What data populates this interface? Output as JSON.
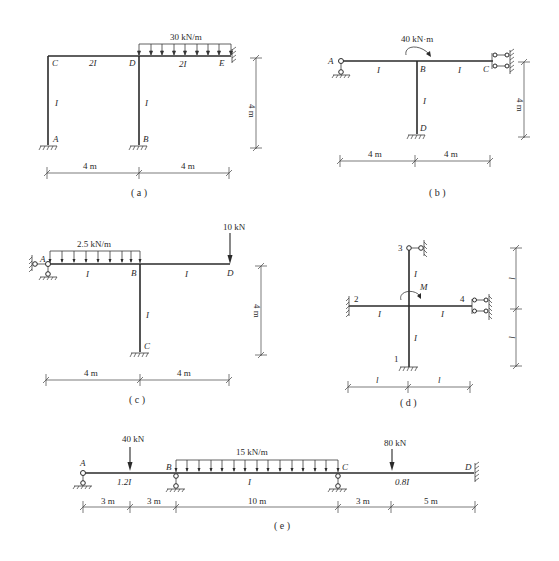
{
  "figure": {
    "panels": [
      {
        "id": "a",
        "caption": "( a )",
        "nodes": [
          "A",
          "B",
          "C",
          "D",
          "E"
        ],
        "members": [
          {
            "from": "C",
            "to": "D",
            "stiffness": "2I"
          },
          {
            "from": "D",
            "to": "E",
            "stiffness": "2I"
          },
          {
            "from": "A",
            "to": "C",
            "stiffness": "I"
          },
          {
            "from": "B",
            "to": "D",
            "stiffness": "I"
          }
        ],
        "supports": {
          "A": "fixed",
          "B": "fixed",
          "E": "fixed"
        },
        "loads": [
          {
            "type": "distributed",
            "on": "D-E",
            "label": "30 kN/m"
          }
        ],
        "dimensions": {
          "horizontal": [
            "4 m",
            "4 m"
          ],
          "vertical": [
            "4 m"
          ]
        }
      },
      {
        "id": "b",
        "caption": "( b )",
        "nodes": [
          "A",
          "B",
          "C",
          "D"
        ],
        "members": [
          {
            "from": "A",
            "to": "B",
            "stiffness": "I"
          },
          {
            "from": "B",
            "to": "C",
            "stiffness": "I"
          },
          {
            "from": "B",
            "to": "D",
            "stiffness": "I"
          }
        ],
        "supports": {
          "A": "pin",
          "C": "sliding",
          "D": "fixed"
        },
        "loads": [
          {
            "type": "moment",
            "at": "B",
            "label": "40 kN·m"
          }
        ],
        "dimensions": {
          "horizontal": [
            "4 m",
            "4 m"
          ],
          "vertical": [
            "4 m"
          ]
        }
      },
      {
        "id": "c",
        "caption": "( c )",
        "nodes": [
          "A",
          "B",
          "C",
          "D"
        ],
        "members": [
          {
            "from": "A",
            "to": "B",
            "stiffness": "I"
          },
          {
            "from": "B",
            "to": "D",
            "stiffness": "I"
          },
          {
            "from": "B",
            "to": "C",
            "stiffness": "I"
          }
        ],
        "supports": {
          "A": "pin",
          "C": "fixed"
        },
        "loads": [
          {
            "type": "distributed",
            "on": "A-B",
            "label": "2.5 kN/m"
          },
          {
            "type": "point",
            "at": "D",
            "label": "10 kN"
          }
        ],
        "dimensions": {
          "horizontal": [
            "4 m",
            "4 m"
          ],
          "vertical": [
            "4 m"
          ]
        }
      },
      {
        "id": "d",
        "caption": "( d )",
        "nodes": [
          "1",
          "2",
          "3",
          "4"
        ],
        "members": [
          {
            "from": "2",
            "to": "center",
            "stiffness": "I"
          },
          {
            "from": "center",
            "to": "4",
            "stiffness": "I"
          },
          {
            "from": "3",
            "to": "center",
            "stiffness": "I"
          },
          {
            "from": "center",
            "to": "1",
            "stiffness": "I"
          }
        ],
        "supports": {
          "1": "fixed",
          "2": "fixed",
          "3": "roller",
          "4": "sliding"
        },
        "loads": [
          {
            "type": "moment",
            "at": "center",
            "label": "M"
          }
        ],
        "dimensions": {
          "horizontal": [
            "l",
            "l"
          ],
          "vertical": [
            "l",
            "l"
          ]
        }
      },
      {
        "id": "e",
        "caption": "( e )",
        "nodes": [
          "A",
          "B",
          "C",
          "D"
        ],
        "members": [
          {
            "from": "A",
            "to": "B",
            "stiffness": "1.2I"
          },
          {
            "from": "B",
            "to": "C",
            "stiffness": "I"
          },
          {
            "from": "C",
            "to": "D",
            "stiffness": "0.8I"
          }
        ],
        "supports": {
          "A": "pin",
          "B": "pin",
          "C": "pin",
          "D": "fixed"
        },
        "loads": [
          {
            "type": "point",
            "on": "A-B",
            "label": "40 kN"
          },
          {
            "type": "distributed",
            "on": "B-C",
            "label": "15 kN/m"
          },
          {
            "type": "point",
            "on": "C-D",
            "label": "80 kN"
          }
        ],
        "dimensions": {
          "horizontal": [
            "3 m",
            "3 m",
            "10 m",
            "3 m",
            "5 m"
          ]
        }
      }
    ]
  },
  "a": {
    "load": "30 kN/m",
    "C": "C",
    "D": "D",
    "E": "E",
    "A": "A",
    "B": "B",
    "stiff_CD": "2I",
    "stiff_DE": "2I",
    "stiff_AC": "I",
    "stiff_BD": "I",
    "dim_h1": "4 m",
    "dim_h2": "4 m",
    "dim_v": "4 m",
    "caption": "( a )"
  },
  "b": {
    "moment": "40 kN·m",
    "A": "A",
    "B": "B",
    "C": "C",
    "D": "D",
    "stiff_AB": "I",
    "stiff_BC": "I",
    "stiff_BD": "I",
    "dim_h1": "4 m",
    "dim_h2": "4 m",
    "dim_v": "4 m",
    "caption": "( b )"
  },
  "c": {
    "load_dist": "2.5 kN/m",
    "load_point": "10 kN",
    "A": "A",
    "B": "B",
    "C": "C",
    "D": "D",
    "stiff_AB": "I",
    "stiff_BD": "I",
    "stiff_BC": "I",
    "dim_h1": "4 m",
    "dim_h2": "4 m",
    "dim_v": "4 m",
    "caption": "( c )"
  },
  "d": {
    "moment": "M",
    "n1": "1",
    "n2": "2",
    "n3": "3",
    "n4": "4",
    "stiff_left": "I",
    "stiff_right": "I",
    "stiff_top": "I",
    "stiff_bottom": "I",
    "dim_h1": "l",
    "dim_h2": "l",
    "dim_v1": "l",
    "dim_v2": "l",
    "caption": "( d )"
  },
  "e": {
    "load_p1": "40 kN",
    "load_dist": "15 kN/m",
    "load_p2": "80 kN",
    "A": "A",
    "B": "B",
    "C": "C",
    "D": "D",
    "stiff_AB": "1.2I",
    "stiff_BC": "I",
    "stiff_CD": "0.8I",
    "dims": [
      "3 m",
      "3 m",
      "10 m",
      "3 m",
      "5 m"
    ],
    "caption": "( e )"
  }
}
